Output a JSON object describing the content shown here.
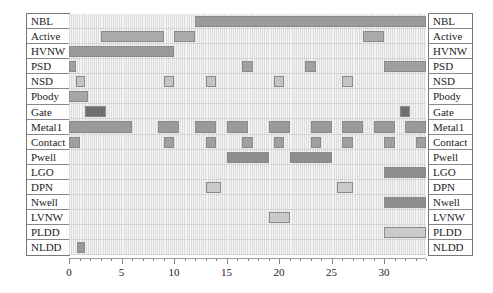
{
  "chart_data": {
    "type": "gantt",
    "title": "",
    "xlabel": "",
    "ylabel": "",
    "xlim": [
      0,
      34
    ],
    "x_ticks": [
      0,
      5,
      10,
      15,
      20,
      25,
      30
    ],
    "grid": true,
    "rows": [
      "NBL",
      "Active",
      "HVNW",
      "PSD",
      "NSD",
      "Pbody",
      "Gate",
      "Metal1",
      "Contact",
      "Pwell",
      "LGO",
      "DPN",
      "Nwell",
      "LVNW",
      "PLDD",
      "NLDD"
    ],
    "series": [
      {
        "name": "NBL",
        "segments": [
          [
            12,
            34
          ]
        ],
        "color": "#9a9a9a"
      },
      {
        "name": "Active",
        "segments": [
          [
            3,
            9
          ],
          [
            10,
            12
          ],
          [
            28,
            30
          ]
        ],
        "color": "#aaaaaa"
      },
      {
        "name": "HVNW",
        "segments": [
          [
            0,
            10
          ]
        ],
        "color": "#9a9a9a"
      },
      {
        "name": "PSD",
        "segments": [
          [
            0,
            0.7
          ],
          [
            16.5,
            17.5
          ],
          [
            22.5,
            23.5
          ],
          [
            30,
            34
          ]
        ],
        "color": "#a0a0a0"
      },
      {
        "name": "NSD",
        "segments": [
          [
            0.7,
            1.5
          ],
          [
            9,
            10
          ],
          [
            13,
            14
          ],
          [
            19.5,
            20.5
          ],
          [
            26,
            27
          ]
        ],
        "color": "#c4c4c4"
      },
      {
        "name": "Pbody",
        "segments": [
          [
            0,
            1.8
          ]
        ],
        "color": "#a6a6a6"
      },
      {
        "name": "Gate",
        "segments": [
          [
            1.5,
            3.5
          ],
          [
            31.5,
            32.5
          ]
        ],
        "color": "#6e6e6e"
      },
      {
        "name": "Metal1",
        "segments": [
          [
            0,
            6
          ],
          [
            8.5,
            10.5
          ],
          [
            12,
            14
          ],
          [
            15,
            17
          ],
          [
            19,
            21
          ],
          [
            23,
            25
          ],
          [
            26,
            28
          ],
          [
            29,
            31
          ],
          [
            32,
            34
          ]
        ],
        "color": "#9a9a9a"
      },
      {
        "name": "Contact",
        "segments": [
          [
            0,
            1
          ],
          [
            9,
            10
          ],
          [
            13,
            14
          ],
          [
            16.5,
            17.5
          ],
          [
            19.5,
            20.5
          ],
          [
            23,
            24
          ],
          [
            26,
            27
          ],
          [
            30,
            31
          ],
          [
            33,
            34
          ]
        ],
        "color": "#a0a0a0"
      },
      {
        "name": "Pwell",
        "segments": [
          [
            15,
            19
          ],
          [
            21,
            25
          ]
        ],
        "color": "#8e8e8e"
      },
      {
        "name": "LGO",
        "segments": [
          [
            30,
            34
          ]
        ],
        "color": "#8e8e8e"
      },
      {
        "name": "DPN",
        "segments": [
          [
            13,
            14.5
          ],
          [
            25.5,
            27
          ]
        ],
        "color": "#cacaca"
      },
      {
        "name": "Nwell",
        "segments": [
          [
            30,
            34
          ]
        ],
        "color": "#8e8e8e"
      },
      {
        "name": "LVNW",
        "segments": [
          [
            19,
            21
          ]
        ],
        "color": "#cacaca"
      },
      {
        "name": "PLDD",
        "segments": [
          [
            30,
            34
          ]
        ],
        "color": "#cacaca"
      },
      {
        "name": "NLDD",
        "segments": [
          [
            0.8,
            1.5
          ]
        ],
        "color": "#9a9a9a"
      }
    ]
  },
  "labels": {
    "left": [
      "NBL",
      "Active",
      "HVNW",
      "PSD",
      "NSD",
      "Pbody",
      "Gate",
      "Metal1",
      "Contact",
      "Pwell",
      "LGO",
      "DPN",
      "Nwell",
      "LVNW",
      "PLDD",
      "NLDD"
    ],
    "right": [
      "NBL",
      "Active",
      "HVNW",
      "PSD",
      "NSD",
      "Pbody",
      "Gate",
      "Metal1",
      "Contact",
      "Pwell",
      "LGO",
      "DPN",
      "Nwell",
      "LVNW",
      "PLDD",
      "NLDD"
    ]
  },
  "axis": {
    "tick_labels": [
      "0",
      "5",
      "10",
      "15",
      "20",
      "25",
      "30"
    ]
  }
}
